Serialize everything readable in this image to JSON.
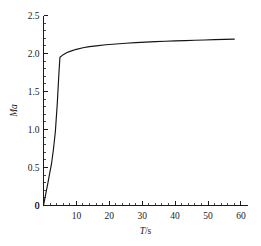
{
  "chart_data": {
    "type": "line",
    "title": "",
    "subtitle": "",
    "xlabel": "T/s",
    "xlabel_symbol": "T",
    "xlabel_unit": "/s",
    "ylabel": "Ma",
    "xlim": [
      0,
      62
    ],
    "ylim": [
      0,
      2.5
    ],
    "grid": false,
    "legend": false,
    "legend_position": "none",
    "x_ticks": [
      0,
      10,
      20,
      30,
      40,
      50,
      60
    ],
    "x_tick_labels": [
      "0",
      "10",
      "20",
      "30",
      "40",
      "50",
      "60"
    ],
    "x_minor_tick_step": 2,
    "y_ticks": [
      0,
      0.5,
      1.0,
      1.5,
      2.0,
      2.5
    ],
    "y_tick_labels": [
      "0",
      "0.5",
      "1.0",
      "1.5",
      "2.0",
      "2.5"
    ],
    "y_minor_tick_step": 0.1,
    "line_color": "#141414",
    "series": [
      {
        "name": "Ma",
        "x": [
          0.0,
          0.4,
          0.9,
          1.4,
          1.9,
          2.4,
          3.0,
          3.6,
          4.2,
          4.7,
          5.0,
          6.0,
          7.0,
          8.5,
          10.0,
          12.0,
          14.0,
          16.0,
          19.0,
          22.0,
          25.0,
          28.0,
          31.0,
          34.0,
          37.0,
          40.0,
          43.0,
          46.0,
          49.0,
          52.0,
          55.0,
          58.0
        ],
        "y": [
          0.0,
          0.09,
          0.2,
          0.31,
          0.43,
          0.54,
          0.73,
          0.97,
          1.35,
          1.75,
          1.95,
          1.985,
          2.01,
          2.035,
          2.055,
          2.075,
          2.09,
          2.1,
          2.115,
          2.125,
          2.135,
          2.143,
          2.15,
          2.156,
          2.161,
          2.166,
          2.17,
          2.174,
          2.178,
          2.182,
          2.186,
          2.19
        ]
      }
    ],
    "annotations": [
      {
        "text": "knee point",
        "x": 5.0,
        "y": 1.95
      },
      {
        "text": "asymptotic value",
        "x": 58.0,
        "y": 2.19
      }
    ]
  }
}
